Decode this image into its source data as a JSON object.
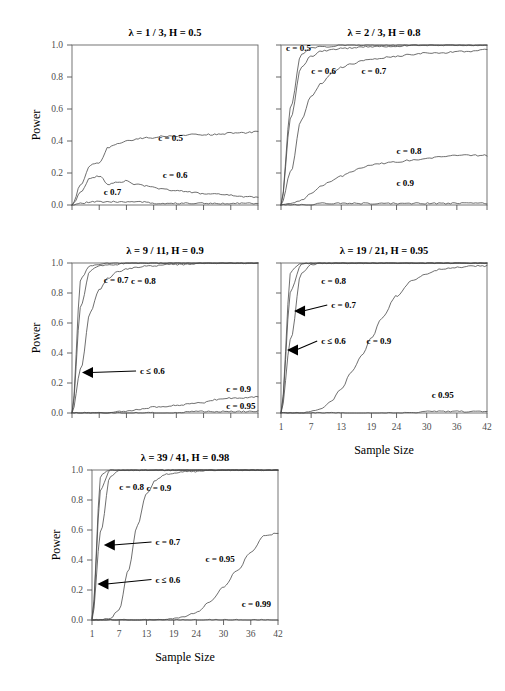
{
  "figure": {
    "axis_titles": {
      "x": "Sample Size",
      "y": "Power"
    },
    "y_ticks": [
      "0.0",
      "0.2",
      "0.4",
      "0.6",
      "0.8",
      "1.0"
    ],
    "y_tick_values": [
      0.0,
      0.2,
      0.4,
      0.6,
      0.8,
      1.0
    ],
    "x_ticks": [
      "1",
      "7",
      "13",
      "19",
      "24",
      "30",
      "36",
      "42"
    ],
    "x_tick_values": [
      1,
      7,
      13,
      19,
      24,
      30,
      36,
      42
    ],
    "ylim": [
      0.0,
      1.0
    ],
    "xlim": [
      1,
      42
    ],
    "grid": false,
    "legend_position": "inline-curve-labels",
    "line_color": "#4a4a4a",
    "text_color": "#000000",
    "tick_color": "#4d4d4d"
  },
  "chart_data": [
    {
      "type": "line",
      "panel": 1,
      "title": "λ = 1 / 3, H = 0.5",
      "xlabel": "",
      "ylabel": "Power",
      "xlim": [
        1,
        42
      ],
      "ylim": [
        0.0,
        1.0
      ],
      "grid": false,
      "show_x_tick_labels": false,
      "show_y_tick_labels": true,
      "x": [
        1,
        3,
        5,
        7,
        9,
        11,
        13,
        15,
        17,
        19,
        21,
        24,
        27,
        30,
        33,
        36,
        39,
        42
      ],
      "series": [
        {
          "name": "c = 0.5",
          "label": "c = 0.5",
          "values": [
            0.0,
            0.13,
            0.25,
            0.26,
            0.36,
            0.38,
            0.4,
            0.41,
            0.42,
            0.42,
            0.43,
            0.43,
            0.44,
            0.44,
            0.44,
            0.45,
            0.45,
            0.46
          ]
        },
        {
          "name": "c = 0.6",
          "label": "c = 0.6",
          "values": [
            0.0,
            0.08,
            0.17,
            0.18,
            0.13,
            0.14,
            0.15,
            0.13,
            0.12,
            0.11,
            0.1,
            0.09,
            0.08,
            0.07,
            0.07,
            0.06,
            0.05,
            0.05
          ]
        },
        {
          "name": "c  0.7",
          "label": "c    0.7",
          "values": [
            0.0,
            0.01,
            0.02,
            0.02,
            0.02,
            0.02,
            0.02,
            0.02,
            0.02,
            0.01,
            0.01,
            0.01,
            0.01,
            0.01,
            0.01,
            0.01,
            0.01,
            0.01
          ]
        }
      ],
      "annotations": [
        {
          "text": "c = 0.5",
          "x": 20,
          "y": 0.4
        },
        {
          "text": "c = 0.6",
          "x": 21,
          "y": 0.17
        },
        {
          "text": "c    0.7",
          "x": 8,
          "y": 0.06
        }
      ]
    },
    {
      "type": "line",
      "panel": 2,
      "title": "λ = 2 / 3, H = 0.8",
      "xlabel": "",
      "ylabel": "",
      "xlim": [
        1,
        42
      ],
      "ylim": [
        0.0,
        1.0
      ],
      "grid": false,
      "show_x_tick_labels": false,
      "show_y_tick_labels": false,
      "x": [
        1,
        3,
        5,
        7,
        9,
        11,
        13,
        15,
        17,
        19,
        21,
        24,
        27,
        30,
        33,
        36,
        39,
        42
      ],
      "series": [
        {
          "name": "c = 0.5",
          "label": "c = 0.5",
          "values": [
            0.0,
            0.62,
            0.94,
            0.98,
            0.99,
            0.99,
            1.0,
            1.0,
            1.0,
            1.0,
            1.0,
            1.0,
            1.0,
            1.0,
            1.0,
            1.0,
            1.0,
            1.0
          ]
        },
        {
          "name": "c = 0.6",
          "label": "c = 0.6",
          "values": [
            0.0,
            0.55,
            0.86,
            0.93,
            0.96,
            0.97,
            0.98,
            0.98,
            0.99,
            0.99,
            0.99,
            0.99,
            1.0,
            1.0,
            1.0,
            1.0,
            1.0,
            1.0
          ]
        },
        {
          "name": "c = 0.7",
          "label": "c = 0.7",
          "values": [
            0.0,
            0.21,
            0.53,
            0.68,
            0.76,
            0.82,
            0.86,
            0.88,
            0.9,
            0.91,
            0.92,
            0.93,
            0.94,
            0.95,
            0.95,
            0.96,
            0.96,
            0.97
          ]
        },
        {
          "name": "c = 0.8",
          "label": "c = 0.8",
          "values": [
            0.0,
            0.01,
            0.03,
            0.07,
            0.12,
            0.15,
            0.18,
            0.21,
            0.23,
            0.25,
            0.26,
            0.27,
            0.28,
            0.29,
            0.3,
            0.31,
            0.31,
            0.31
          ]
        },
        {
          "name": "c  0.9",
          "label": "c    0.9",
          "values": [
            0.0,
            0.0,
            0.0,
            0.0,
            0.01,
            0.01,
            0.01,
            0.01,
            0.01,
            0.01,
            0.01,
            0.01,
            0.01,
            0.01,
            0.01,
            0.01,
            0.01,
            0.01
          ]
        }
      ],
      "annotations": [
        {
          "text": "c = 0.5",
          "x": 2,
          "y": 0.96
        },
        {
          "text": "c = 0.6",
          "x": 7,
          "y": 0.82
        },
        {
          "text": "c = 0.7",
          "x": 17,
          "y": 0.82
        },
        {
          "text": "c = 0.8",
          "x": 24,
          "y": 0.32
        },
        {
          "text": "c    0.9",
          "x": 24,
          "y": 0.12
        }
      ]
    },
    {
      "type": "line",
      "panel": 3,
      "title": "λ = 9 / 11, H = 0.9",
      "xlabel": "",
      "ylabel": "Power",
      "xlim": [
        1,
        42
      ],
      "ylim": [
        0.0,
        1.0
      ],
      "grid": false,
      "show_x_tick_labels": false,
      "show_y_tick_labels": true,
      "x": [
        1,
        3,
        5,
        7,
        9,
        11,
        13,
        15,
        17,
        19,
        21,
        24,
        27,
        30,
        33,
        36,
        39,
        42
      ],
      "series": [
        {
          "name": "c ≤ 0.6",
          "label": "c ≤ 0.6",
          "values": [
            0.0,
            0.9,
            0.98,
            0.99,
            1.0,
            1.0,
            1.0,
            1.0,
            1.0,
            1.0,
            1.0,
            1.0,
            1.0,
            1.0,
            1.0,
            1.0,
            1.0,
            1.0
          ]
        },
        {
          "name": "c = 0.7",
          "label": "c = 0.7",
          "values": [
            0.0,
            0.72,
            0.95,
            0.98,
            0.99,
            0.99,
            1.0,
            1.0,
            1.0,
            1.0,
            1.0,
            1.0,
            1.0,
            1.0,
            1.0,
            1.0,
            1.0,
            1.0
          ]
        },
        {
          "name": "c = 0.8",
          "label": "c = 0.8",
          "values": [
            0.0,
            0.3,
            0.67,
            0.82,
            0.9,
            0.94,
            0.96,
            0.97,
            0.98,
            0.98,
            0.99,
            0.99,
            0.99,
            1.0,
            1.0,
            1.0,
            1.0,
            1.0
          ]
        },
        {
          "name": "c = 0.9",
          "label": "c = 0.9",
          "values": [
            0.0,
            0.0,
            0.0,
            0.0,
            0.0,
            0.01,
            0.01,
            0.02,
            0.03,
            0.04,
            0.04,
            0.05,
            0.06,
            0.07,
            0.09,
            0.1,
            0.1,
            0.11
          ]
        },
        {
          "name": "c = 0.95",
          "label": "c = 0.95",
          "values": [
            0.0,
            0.0,
            0.0,
            0.0,
            0.0,
            0.0,
            0.0,
            0.0,
            0.0,
            0.0,
            0.0,
            0.0,
            0.01,
            0.01,
            0.01,
            0.01,
            0.01,
            0.01
          ]
        }
      ],
      "annotations": [
        {
          "text": "c = 0.7",
          "x": 8,
          "y": 0.87
        },
        {
          "text": "c = 0.8",
          "x": 14,
          "y": 0.86
        },
        {
          "text": "c ≤ 0.6",
          "x": 16,
          "y": 0.26,
          "arrow_to_x": 3.2,
          "arrow_to_y": 0.27
        },
        {
          "text": "c = 0.9",
          "x": 35,
          "y": 0.14
        },
        {
          "text": "c = 0.95",
          "x": 35,
          "y": 0.03
        }
      ]
    },
    {
      "type": "line",
      "panel": 4,
      "title": "λ = 19 / 21, H = 0.95",
      "xlabel": "Sample Size",
      "ylabel": "",
      "xlim": [
        1,
        42
      ],
      "ylim": [
        0.0,
        1.0
      ],
      "grid": false,
      "show_x_tick_labels": true,
      "show_y_tick_labels": false,
      "x": [
        1,
        3,
        5,
        7,
        9,
        11,
        13,
        15,
        17,
        19,
        21,
        24,
        27,
        30,
        33,
        36,
        39,
        42
      ],
      "series": [
        {
          "name": "c ≤ 0.6",
          "label": "c ≤ 0.6",
          "values": [
            0.0,
            0.95,
            1.0,
            1.0,
            1.0,
            1.0,
            1.0,
            1.0,
            1.0,
            1.0,
            1.0,
            1.0,
            1.0,
            1.0,
            1.0,
            1.0,
            1.0,
            1.0
          ]
        },
        {
          "name": "c = 0.7",
          "label": "c = 0.7",
          "values": [
            0.0,
            0.82,
            0.99,
            1.0,
            1.0,
            1.0,
            1.0,
            1.0,
            1.0,
            1.0,
            1.0,
            1.0,
            1.0,
            1.0,
            1.0,
            1.0,
            1.0,
            1.0
          ]
        },
        {
          "name": "c = 0.8",
          "label": "c = 0.8",
          "values": [
            0.0,
            0.5,
            0.93,
            0.99,
            1.0,
            1.0,
            1.0,
            1.0,
            1.0,
            1.0,
            1.0,
            1.0,
            1.0,
            1.0,
            1.0,
            1.0,
            1.0,
            1.0
          ]
        },
        {
          "name": "c = 0.9",
          "label": "c = 0.9",
          "values": [
            0.0,
            0.0,
            0.0,
            0.01,
            0.03,
            0.08,
            0.16,
            0.27,
            0.38,
            0.5,
            0.63,
            0.78,
            0.88,
            0.93,
            0.96,
            0.97,
            0.98,
            0.98
          ]
        },
        {
          "name": "c  0.95",
          "label": "c    0.95",
          "values": [
            0.0,
            0.0,
            0.0,
            0.0,
            0.0,
            0.0,
            0.0,
            0.0,
            0.0,
            0.0,
            0.0,
            0.0,
            0.0,
            0.01,
            0.01,
            0.01,
            0.01,
            0.01
          ]
        }
      ],
      "annotations": [
        {
          "text": "c = 0.8",
          "x": 9,
          "y": 0.86
        },
        {
          "text": "c = 0.7",
          "x": 11,
          "y": 0.7,
          "arrow_to_x": 3.6,
          "arrow_to_y": 0.68
        },
        {
          "text": "c ≤ 0.6",
          "x": 9,
          "y": 0.46,
          "arrow_to_x": 2.2,
          "arrow_to_y": 0.42
        },
        {
          "text": "c = 0.9",
          "x": 18,
          "y": 0.46
        },
        {
          "text": "c    0.95",
          "x": 31,
          "y": 0.1
        }
      ]
    },
    {
      "type": "line",
      "panel": 5,
      "title": "λ = 39 / 41, H = 0.98",
      "xlabel": "Sample Size",
      "ylabel": "Power",
      "xlim": [
        1,
        42
      ],
      "ylim": [
        0.0,
        1.0
      ],
      "grid": false,
      "show_x_tick_labels": true,
      "show_y_tick_labels": true,
      "x": [
        1,
        3,
        5,
        7,
        9,
        11,
        13,
        15,
        17,
        19,
        21,
        24,
        27,
        30,
        33,
        36,
        39,
        42
      ],
      "series": [
        {
          "name": "c ≤ 0.6",
          "label": "c ≤ 0.6",
          "values": [
            0.01,
            0.97,
            1.0,
            1.0,
            1.0,
            1.0,
            1.0,
            1.0,
            1.0,
            1.0,
            1.0,
            1.0,
            1.0,
            1.0,
            1.0,
            1.0,
            1.0,
            1.0
          ]
        },
        {
          "name": "c = 0.7",
          "label": "c = 0.7",
          "values": [
            0.01,
            0.88,
            1.0,
            1.0,
            1.0,
            1.0,
            1.0,
            1.0,
            1.0,
            1.0,
            1.0,
            1.0,
            1.0,
            1.0,
            1.0,
            1.0,
            1.0,
            1.0
          ]
        },
        {
          "name": "c = 0.8",
          "label": "c = 0.8",
          "values": [
            0.0,
            0.6,
            0.96,
            1.0,
            1.0,
            1.0,
            1.0,
            1.0,
            1.0,
            1.0,
            1.0,
            1.0,
            1.0,
            1.0,
            1.0,
            1.0,
            1.0,
            1.0
          ]
        },
        {
          "name": "c = 0.9",
          "label": "c = 0.9",
          "values": [
            0.0,
            0.0,
            0.01,
            0.07,
            0.33,
            0.63,
            0.84,
            0.93,
            0.97,
            0.98,
            0.99,
            0.99,
            1.0,
            1.0,
            1.0,
            1.0,
            1.0,
            1.0
          ]
        },
        {
          "name": "c = 0.95",
          "label": "c = 0.95",
          "values": [
            0.0,
            0.0,
            0.0,
            0.0,
            0.0,
            0.0,
            0.0,
            0.0,
            0.0,
            0.01,
            0.02,
            0.05,
            0.12,
            0.22,
            0.33,
            0.45,
            0.56,
            0.58
          ]
        },
        {
          "name": "c = 0.99",
          "label": "c = 0.99",
          "values": [
            0.0,
            0.0,
            0.0,
            0.0,
            0.0,
            0.0,
            0.0,
            0.0,
            0.0,
            0.0,
            0.0,
            0.0,
            0.0,
            0.0,
            0.0,
            0.0,
            0.0,
            0.0
          ]
        }
      ],
      "annotations": [
        {
          "text": "c = 0.8",
          "x": 7,
          "y": 0.87
        },
        {
          "text": "c = 0.9",
          "x": 13,
          "y": 0.86
        },
        {
          "text": "c = 0.7",
          "x": 15,
          "y": 0.5,
          "arrow_to_x": 3.6,
          "arrow_to_y": 0.5
        },
        {
          "text": "c ≤ 0.6",
          "x": 15,
          "y": 0.25,
          "arrow_to_x": 2.2,
          "arrow_to_y": 0.24
        },
        {
          "text": "c = 0.95",
          "x": 26,
          "y": 0.39
        },
        {
          "text": "c = 0.99",
          "x": 34,
          "y": 0.09
        }
      ]
    }
  ]
}
